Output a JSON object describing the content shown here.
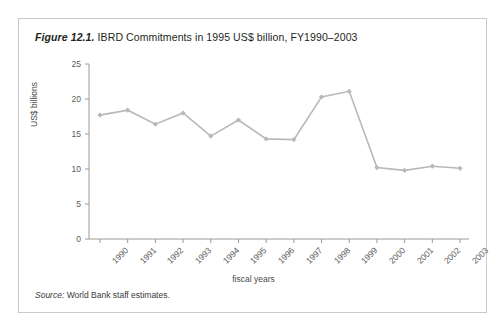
{
  "figure": {
    "number_label": "Figure 12.1.",
    "title_text": " IBRD Commitments in 1995 US$ billion, FY1990–2003",
    "source_label": "Source:",
    "source_text": " World Bank staff estimates."
  },
  "style": {
    "series_color": "#b8b8b8",
    "axis_color": "#9a9a9a",
    "border_color": "#c9c9c9",
    "tick_label_color": "#5a5a5a"
  },
  "chart_data": {
    "type": "line",
    "title": "Figure 12.1. IBRD Commitments in 1995 US$ billion, FY1990–2003",
    "subtitle": "",
    "xlabel": "fiscal years",
    "ylabel": "US$ billions",
    "categories": [
      "1990",
      "1991",
      "1992",
      "1993",
      "1994",
      "1995",
      "1996",
      "1997",
      "1998",
      "1999",
      "2000",
      "2001",
      "2002",
      "2003"
    ],
    "values": [
      17.7,
      18.4,
      16.4,
      18.0,
      14.7,
      17.0,
      14.3,
      14.2,
      20.3,
      21.1,
      10.2,
      9.8,
      10.4,
      10.1
    ],
    "series": [
      {
        "name": "IBRD Commitments",
        "values": [
          17.7,
          18.4,
          16.4,
          18.0,
          14.7,
          17.0,
          14.3,
          14.2,
          20.3,
          21.1,
          10.2,
          9.8,
          10.4,
          10.1
        ]
      }
    ],
    "ylim": [
      0,
      25
    ],
    "yticks": [
      0,
      5,
      10,
      15,
      20,
      25
    ],
    "ytick_labels": [
      "0",
      "5",
      "10",
      "15",
      "20",
      "25"
    ],
    "grid": false,
    "legend": "none",
    "marker": "diamond",
    "xtick_rotation": -45,
    "annotations": [],
    "source": "Source: World Bank staff estimates."
  }
}
